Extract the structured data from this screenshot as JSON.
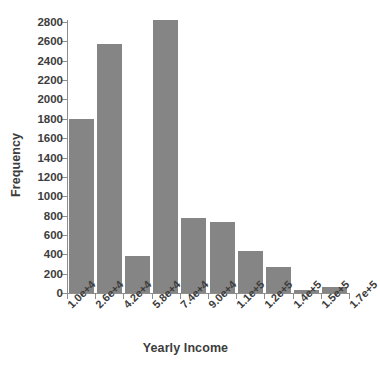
{
  "chart_data": {
    "type": "bar",
    "title": "",
    "subtitle": "",
    "xlabel": "Yearly Income",
    "ylabel": "Frequency",
    "grid": false,
    "legend": false,
    "legend_position": "none",
    "bar_color": "#858585",
    "text_color": "#3d3d3d",
    "axis_color": "#8d8d8d",
    "background": "#ffffff",
    "ylim": [
      0,
      2800
    ],
    "ytick_step": 200,
    "yticks": [
      0,
      200,
      400,
      600,
      800,
      1000,
      1200,
      1400,
      1600,
      1800,
      2000,
      2200,
      2400,
      2600,
      2800
    ],
    "ytick_labels": [
      "0",
      "200",
      "400",
      "600",
      "800",
      "1000",
      "1200",
      "1400",
      "1600",
      "1800",
      "2000",
      "2200",
      "2400",
      "2600",
      "2800"
    ],
    "xtick_labels": [
      "1.0e+4",
      "2.6e+4",
      "4.2e+4",
      "5.8e+4",
      "7.4e+4",
      "9.0e+4",
      "1.1e+5",
      "1.2e+5",
      "1.4e+5",
      "1.5e+5",
      "1.7e+5"
    ],
    "bin_edges": [
      10000,
      26000,
      42000,
      58000,
      74000,
      90000,
      110000,
      120000,
      140000,
      150000,
      170000
    ],
    "categories": [
      "1.0e+4",
      "2.6e+4",
      "4.2e+4",
      "5.8e+4",
      "7.4e+4",
      "9.0e+4",
      "1.1e+5",
      "1.2e+5",
      "1.4e+5",
      "1.5e+5"
    ],
    "values": [
      1800,
      2575,
      385,
      2825,
      775,
      735,
      435,
      270,
      30,
      60
    ]
  }
}
